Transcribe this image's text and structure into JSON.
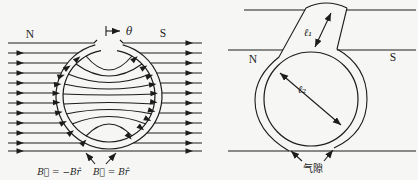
{
  "figure": {
    "diagram_left": {
      "pole_left": "N",
      "pole_right": "S",
      "angle": "θ",
      "label_b_left": "B⃗ = −Br̂",
      "label_b_right": "B⃗ = Br̂"
    },
    "diagram_right": {
      "pole_left": "N",
      "pole_right": "S",
      "len_bar": "ℓ₁",
      "len_sphere": "ℓ₂",
      "air_gap": "气隙"
    }
  },
  "colors": {
    "ink": "#1c1c1c",
    "background": "#f6f6f4"
  }
}
